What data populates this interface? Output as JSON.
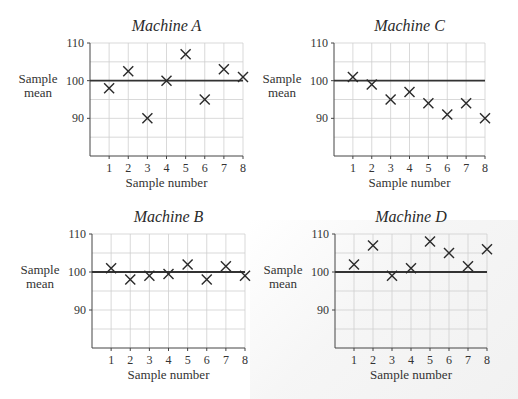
{
  "chart_data": [
    {
      "type": "scatter",
      "title": "Machine A",
      "xlabel": "Sample number",
      "ylabel": "Sample mean",
      "x": [
        1,
        2,
        3,
        4,
        5,
        6,
        7,
        8
      ],
      "values": [
        98,
        102.5,
        90,
        100,
        107,
        95,
        103,
        101
      ],
      "reference_line": 100,
      "yticks": [
        90,
        100,
        110
      ],
      "xticks": [
        1,
        2,
        3,
        4,
        5,
        6,
        7,
        8
      ],
      "ylim": [
        80,
        110
      ],
      "xlim": [
        0,
        8
      ],
      "grid": true,
      "marker": "x"
    },
    {
      "type": "scatter",
      "title": "Machine C",
      "xlabel": "Sample number",
      "ylabel": "Sample mean",
      "x": [
        1,
        2,
        3,
        4,
        5,
        6,
        7,
        8
      ],
      "values": [
        101,
        99,
        95,
        97,
        94,
        91,
        94,
        90
      ],
      "reference_line": 100,
      "yticks": [
        90,
        100,
        110
      ],
      "xticks": [
        1,
        2,
        3,
        4,
        5,
        6,
        7,
        8
      ],
      "ylim": [
        80,
        110
      ],
      "xlim": [
        0,
        8
      ],
      "grid": true,
      "marker": "x"
    },
    {
      "type": "scatter",
      "title": "Machine B",
      "xlabel": "Sample number",
      "ylabel": "Sample mean",
      "x": [
        1,
        2,
        3,
        4,
        5,
        6,
        7,
        8
      ],
      "values": [
        101,
        98,
        99,
        99.5,
        102,
        98,
        101.5,
        99
      ],
      "reference_line": 100,
      "yticks": [
        90,
        100,
        110
      ],
      "xticks": [
        1,
        2,
        3,
        4,
        5,
        6,
        7,
        8
      ],
      "ylim": [
        80,
        110
      ],
      "xlim": [
        0,
        8
      ],
      "grid": true,
      "marker": "x"
    },
    {
      "type": "scatter",
      "title": "Machine D",
      "xlabel": "Sample number",
      "ylabel": "Sample mean",
      "x": [
        1,
        2,
        3,
        4,
        5,
        6,
        7,
        8
      ],
      "values": [
        102,
        107,
        99,
        101,
        108,
        105,
        101.5,
        106
      ],
      "reference_line": 100,
      "yticks": [
        90,
        100,
        110
      ],
      "xticks": [
        1,
        2,
        3,
        4,
        5,
        6,
        7,
        8
      ],
      "ylim": [
        80,
        110
      ],
      "xlim": [
        0,
        8
      ],
      "grid": true,
      "marker": "x"
    }
  ],
  "layout": {
    "panels": [
      {
        "left": 90,
        "right": 243,
        "top": 43,
        "bottom": 156,
        "titleY": 31
      },
      {
        "left": 334,
        "right": 485,
        "top": 43,
        "bottom": 156,
        "titleY": 31
      },
      {
        "left": 92,
        "right": 245,
        "top": 234,
        "bottom": 348,
        "titleY": 222
      },
      {
        "left": 335,
        "right": 487,
        "top": 234,
        "bottom": 348,
        "titleY": 222
      }
    ],
    "ylabel_lines": [
      "Sample",
      "mean"
    ]
  }
}
